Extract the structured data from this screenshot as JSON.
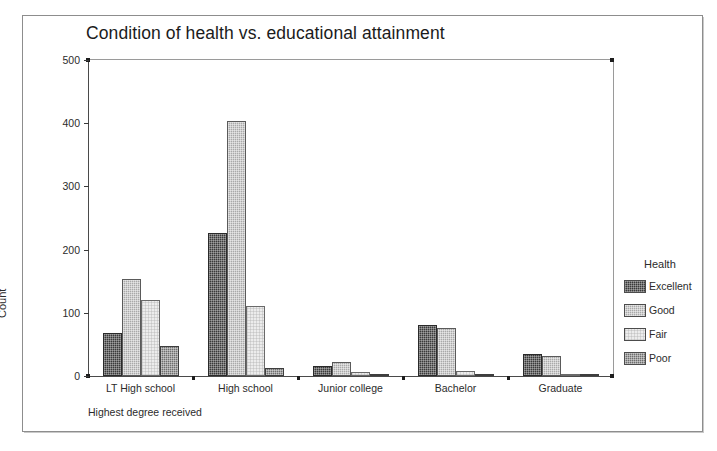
{
  "figure": {
    "title": "Condition of health vs. educational attainment",
    "legend_title": "Health",
    "xaxis_title": "Highest degree received",
    "yaxis_title": "Count"
  },
  "chart_data": {
    "type": "bar",
    "title": "Condition of health vs. educational attainment",
    "xlabel": "Highest degree received",
    "ylabel": "Count",
    "ylim": [
      0,
      500
    ],
    "yticks": [
      0,
      100,
      200,
      300,
      400,
      500
    ],
    "grid": false,
    "legend_title": "Health",
    "legend_position": "right",
    "orientation": "vertical",
    "grouping": "clustered",
    "categories": [
      "LT High school",
      "High school",
      "Junior college",
      "Bachelor",
      "Graduate"
    ],
    "series": [
      {
        "name": "Excellent",
        "color": "#3a3a3a",
        "values": [
          68,
          227,
          16,
          81,
          35
        ]
      },
      {
        "name": "Good",
        "color": "#a9a9a9",
        "values": [
          154,
          403,
          22,
          76,
          31
        ]
      },
      {
        "name": "Fair",
        "color": "#ececec",
        "values": [
          121,
          111,
          6,
          8,
          2
        ]
      },
      {
        "name": "Poor",
        "color": "#6e6e6e",
        "values": [
          48,
          13,
          1,
          2,
          0
        ]
      }
    ]
  }
}
